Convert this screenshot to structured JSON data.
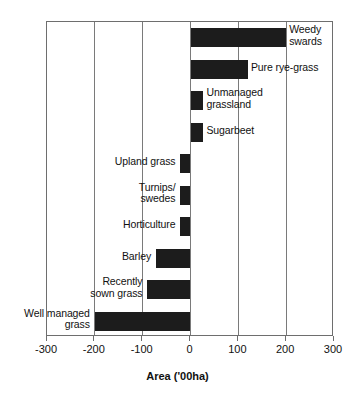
{
  "chart_data": {
    "type": "bar",
    "orientation": "horizontal",
    "title": "",
    "subtitle": "",
    "xlabel": "Area ('00ha)",
    "ylabel": "",
    "xlim": [
      -300,
      300
    ],
    "xticks": [
      -300,
      -200,
      -100,
      0,
      100,
      200,
      300
    ],
    "xticklabels": [
      "-300",
      "-200",
      "-100",
      "0",
      "100",
      "200",
      "300"
    ],
    "grid": true,
    "grid_axis": "x",
    "legend": false,
    "bar_color": "#1c1c1c",
    "categories": [
      "Weedy swards",
      "Pure rye-grass",
      "Unmanaged grassland",
      "Sugarbeet",
      "Upland grass",
      "Turnips/swedes",
      "Horticulture",
      "Barley",
      "Recently sown grass",
      "Well managed grass"
    ],
    "values": [
      200,
      120,
      27,
      27,
      -21,
      -21,
      -21,
      -72,
      -90,
      -200
    ],
    "bars": [
      {
        "label": "Weedy\nswards",
        "value": 200,
        "label_side": "right"
      },
      {
        "label": "Pure rye-grass",
        "value": 120,
        "label_side": "right"
      },
      {
        "label": "Unmanaged\ngrassland",
        "value": 27,
        "label_side": "right"
      },
      {
        "label": "Sugarbeet",
        "value": 27,
        "label_side": "right"
      },
      {
        "label": "Upland grass",
        "value": -21,
        "label_side": "left"
      },
      {
        "label": "Turnips/\nswedes",
        "value": -21,
        "label_side": "left"
      },
      {
        "label": "Horticulture",
        "value": -21,
        "label_side": "left"
      },
      {
        "label": "Barley",
        "value": -72,
        "label_side": "left"
      },
      {
        "label": "Recently\nsown grass",
        "value": -90,
        "label_side": "left"
      },
      {
        "label": "Well managed\ngrass",
        "value": -200,
        "label_side": "left"
      }
    ]
  }
}
